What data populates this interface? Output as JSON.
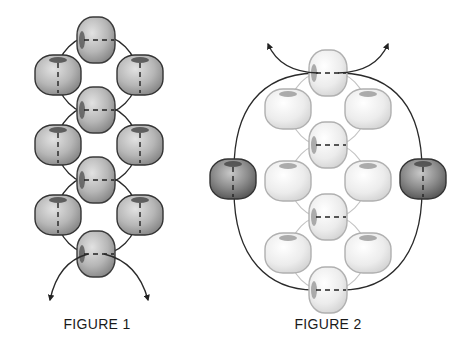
{
  "figures": [
    {
      "caption": "FIGURE 1",
      "caption_pos": [
        97,
        316
      ],
      "bead_fill": "dark",
      "vertical_beads": [
        [
          96,
          40
        ],
        [
          96,
          110
        ],
        [
          96,
          180
        ],
        [
          96,
          254
        ]
      ],
      "side_beads": [
        [
          58,
          75
        ],
        [
          140,
          75
        ],
        [
          58,
          145
        ],
        [
          140,
          145
        ],
        [
          58,
          215
        ],
        [
          140,
          215
        ]
      ],
      "arrows": [
        {
          "from": [
            96,
            254
          ],
          "to": [
            50,
            302
          ],
          "ctrl": [
            60,
            262
          ]
        },
        {
          "from": [
            96,
            254
          ],
          "to": [
            148,
            302
          ],
          "ctrl": [
            136,
            262
          ]
        }
      ]
    },
    {
      "caption": "FIGURE 2",
      "caption_pos": [
        328,
        316
      ],
      "bead_fill": "light",
      "vertical_beads": [
        [
          328,
          73
        ],
        [
          328,
          145
        ],
        [
          328,
          217
        ],
        [
          328,
          290
        ]
      ],
      "side_beads": [
        [
          288,
          109
        ],
        [
          368,
          109
        ],
        [
          288,
          181
        ],
        [
          368,
          181
        ],
        [
          288,
          253
        ],
        [
          368,
          253
        ]
      ],
      "outer_beads": [
        [
          233,
          179
        ],
        [
          423,
          179
        ]
      ],
      "arrows": [
        {
          "from": [
            328,
            73
          ],
          "to": [
            268,
            42
          ],
          "ctrl": [
            282,
            70
          ]
        },
        {
          "from": [
            328,
            73
          ],
          "to": [
            388,
            42
          ],
          "ctrl": [
            374,
            70
          ]
        }
      ]
    }
  ],
  "colors": {
    "dark_bead_edge": "#3a3a3a",
    "dark_bead_light": "#d4d4d4",
    "dark_bead_shadow": "#8a8a8a",
    "light_bead_edge": "#b0b0b0",
    "light_bead_light": "#f6f6f6",
    "light_bead_shadow": "#d0d0d0",
    "outer_bead_shadow": "#555555",
    "thread_dark": "#222222",
    "thread_light": "#c4c4c4"
  }
}
